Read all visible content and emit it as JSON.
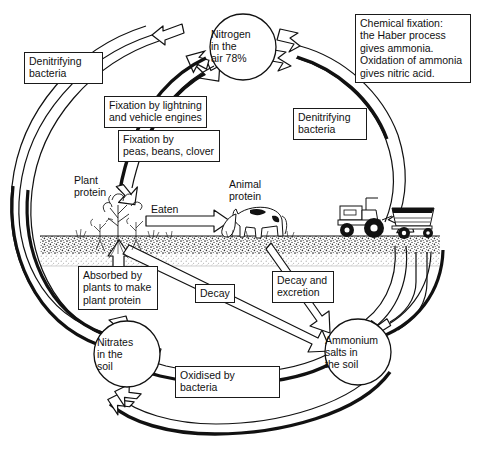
{
  "diagram": {
    "type": "cycle-diagram",
    "colors": {
      "stroke": "#111111",
      "fill": "#ffffff",
      "soil": "#9a9a9a",
      "background": "#ffffff"
    }
  },
  "nodes": {
    "nitrogen_air": "Nitrogen\nin the\nair  78%",
    "nitrates_soil": "Nitrates\nin the\nsoil",
    "ammonium_soil": "Ammonium\nsalts in\nthe soil"
  },
  "boxes": {
    "chemical_fixation": "Chemical fixation:\nthe Haber process\ngives ammonia.\nOxidation of ammonia\ngives nitric acid.",
    "denitrifying_left": "Denitrifying\nbacteria",
    "denitrifying_right": "Denitrifying\nbacteria",
    "fixation_lightning": "Fixation by lightning\nand vehicle engines",
    "fixation_legumes": "Fixation by\npeas, beans, clover",
    "absorbed_by_plants": "Absorbed by\nplants to make\nplant protein",
    "decay": "Decay",
    "decay_excretion": "Decay and\nexcretion",
    "oxidised_by_bacteria": "Oxidised by bacteria"
  },
  "labels": {
    "plant_protein": "Plant\nprotein",
    "animal_protein": "Animal\nprotein",
    "eaten": "Eaten"
  },
  "illustrations": {
    "plants": "plant-illustration",
    "cow": "cow-illustration",
    "tractor": "tractor-illustration",
    "trailer": "trailer-illustration",
    "soil_band": "soil-band"
  }
}
